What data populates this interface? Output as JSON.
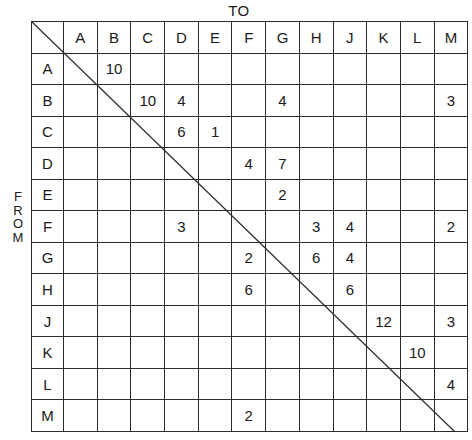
{
  "axis_titles": {
    "columns": "TO",
    "rows": "FROM",
    "rows_letters": [
      "F",
      "R",
      "O",
      "M"
    ]
  },
  "chart_data": {
    "type": "table",
    "title": "",
    "xlabel": "TO",
    "ylabel": "FROM",
    "corner_label": "",
    "categories": [
      "A",
      "B",
      "C",
      "D",
      "E",
      "F",
      "G",
      "H",
      "J",
      "K",
      "L",
      "M"
    ],
    "row_labels": [
      "A",
      "B",
      "C",
      "D",
      "E",
      "F",
      "G",
      "H",
      "J",
      "K",
      "L",
      "M"
    ],
    "column_headers": [
      "A",
      "B",
      "C",
      "D",
      "E",
      "F",
      "G",
      "H",
      "J",
      "K",
      "L",
      "M"
    ],
    "rows": [
      {
        "label": "A",
        "values": [
          "",
          "10",
          "",
          "",
          "",
          "",
          "",
          "",
          "",
          "",
          "",
          ""
        ]
      },
      {
        "label": "B",
        "values": [
          "",
          "",
          "10",
          "4",
          "",
          "",
          "4",
          "",
          "",
          "",
          "",
          "3"
        ]
      },
      {
        "label": "C",
        "values": [
          "",
          "",
          "",
          "6",
          "1",
          "",
          "",
          "",
          "",
          "",
          "",
          ""
        ]
      },
      {
        "label": "D",
        "values": [
          "",
          "",
          "",
          "",
          "",
          "4",
          "7",
          "",
          "",
          "",
          "",
          ""
        ]
      },
      {
        "label": "E",
        "values": [
          "",
          "",
          "",
          "",
          "",
          "",
          "2",
          "",
          "",
          "",
          "",
          ""
        ]
      },
      {
        "label": "F",
        "values": [
          "",
          "",
          "",
          "3",
          "",
          "",
          "",
          "3",
          "4",
          "",
          "",
          "2"
        ]
      },
      {
        "label": "G",
        "values": [
          "",
          "",
          "",
          "",
          "",
          "2",
          "",
          "6",
          "4",
          "",
          "",
          ""
        ]
      },
      {
        "label": "H",
        "values": [
          "",
          "",
          "",
          "",
          "",
          "6",
          "",
          "",
          "6",
          "",
          "",
          ""
        ]
      },
      {
        "label": "J",
        "values": [
          "",
          "",
          "",
          "",
          "",
          "",
          "",
          "",
          "",
          "12",
          "",
          "3"
        ]
      },
      {
        "label": "K",
        "values": [
          "",
          "",
          "",
          "",
          "",
          "",
          "",
          "",
          "",
          "",
          "10",
          ""
        ]
      },
      {
        "label": "L",
        "values": [
          "",
          "",
          "",
          "",
          "",
          "",
          "",
          "",
          "",
          "",
          "",
          "4"
        ]
      },
      {
        "label": "M",
        "values": [
          "",
          "",
          "",
          "",
          "",
          "2",
          "",
          "",
          "",
          "",
          "",
          ""
        ]
      }
    ]
  },
  "colors": {
    "grid_line": "#2b2b2b",
    "text": "#1a1a1a",
    "background": "#ffffff",
    "diagonal": "#2b2b2b"
  }
}
